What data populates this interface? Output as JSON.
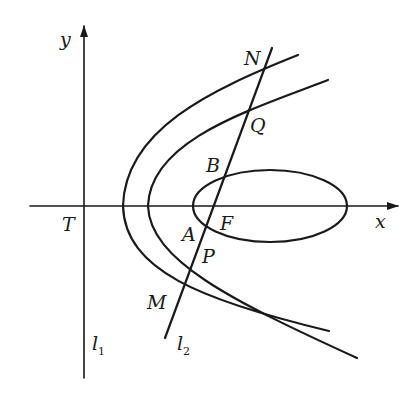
{
  "figure": {
    "axes": {
      "x_label": "x",
      "y_label": "y"
    },
    "points": {
      "T": "T",
      "N": "N",
      "Q": "Q",
      "B": "B",
      "F": "F",
      "A": "A",
      "P": "P",
      "M": "M"
    },
    "lines": {
      "l1": {
        "main": "l",
        "sub": "1"
      },
      "l2": {
        "main": "l",
        "sub": "2"
      }
    },
    "curves": [
      "outer-parabola",
      "inner-parabola",
      "ellipse"
    ],
    "colors": {
      "ink": "#1a1a1a",
      "background": "#ffffff"
    }
  }
}
